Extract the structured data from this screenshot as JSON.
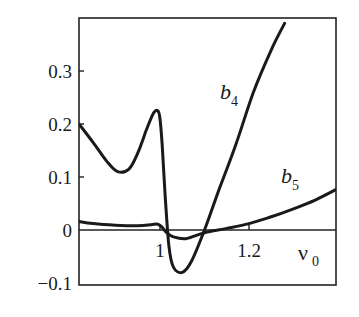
{
  "chart_data": {
    "type": "line",
    "title": "",
    "xlabel": "ν0",
    "ylabel": "",
    "xlim": [
      0.818,
      1.395
    ],
    "ylim": [
      -0.1,
      0.39
    ],
    "grid": false,
    "legend": "inline labels on curves",
    "x_ticks": [
      {
        "value": 1,
        "label": "1"
      },
      {
        "value": 1.2,
        "label": "1.2"
      }
    ],
    "y_ticks": [
      {
        "value": 0.3,
        "label": "0.3"
      },
      {
        "value": 0.2,
        "label": "0.2"
      },
      {
        "value": 0.1,
        "label": "0.1"
      },
      {
        "value": 0,
        "label": "0"
      },
      {
        "value": -0.1,
        "label": "−0.1"
      }
    ],
    "zero_line": true,
    "series": [
      {
        "name": "b4",
        "label_main": "b",
        "label_sub": "4",
        "x": [
          0.818,
          0.85,
          0.88,
          0.905,
          0.93,
          0.95,
          0.97,
          0.985,
          0.995,
          1.0,
          1.005,
          1.012,
          1.02,
          1.03,
          1.05,
          1.07,
          1.1,
          1.13,
          1.17,
          1.21,
          1.25,
          1.28
        ],
        "values": [
          0.2,
          0.165,
          0.13,
          0.11,
          0.115,
          0.145,
          0.19,
          0.22,
          0.225,
          0.21,
          0.16,
          0.06,
          -0.03,
          -0.07,
          -0.08,
          -0.06,
          0.0,
          0.07,
          0.16,
          0.26,
          0.34,
          0.39
        ]
      },
      {
        "name": "b5",
        "label_main": "b",
        "label_sub": "5",
        "x": [
          0.818,
          0.85,
          0.9,
          0.95,
          0.98,
          0.995,
          1.005,
          1.015,
          1.03,
          1.06,
          1.1,
          1.15,
          1.2,
          1.25,
          1.3,
          1.35,
          1.395
        ],
        "values": [
          0.016,
          0.012,
          0.009,
          0.008,
          0.01,
          0.011,
          0.005,
          -0.005,
          -0.013,
          -0.016,
          -0.005,
          0.003,
          0.012,
          0.025,
          0.04,
          0.057,
          0.076
        ]
      }
    ]
  }
}
